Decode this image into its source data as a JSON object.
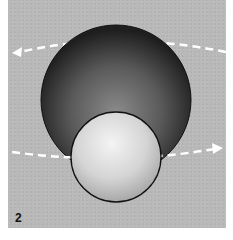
{
  "figure": {
    "panel_number": "2",
    "colors": {
      "background": "#b9b9b9",
      "large_sphere_light": "#8a8a8a",
      "large_sphere_dark": "#1e1e1e",
      "small_sphere_light": "#f4f4f4",
      "small_sphere_dark": "#a8a8a8",
      "arrow": "#ffffff",
      "outline": "#111111"
    },
    "arrows": [
      {
        "id": "upper-arrow",
        "direction": "right-to-left",
        "style": "dashed"
      },
      {
        "id": "lower-arrow",
        "direction": "left-to-right",
        "style": "dashed"
      }
    ]
  }
}
